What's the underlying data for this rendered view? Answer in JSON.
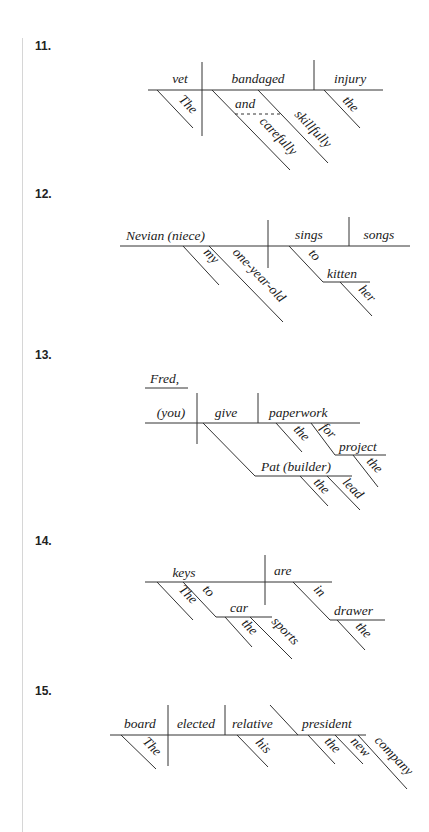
{
  "diagrams": [
    {
      "number": "11.",
      "baseline": {
        "subject": "vet",
        "verb": "bandaged",
        "object": "injury"
      },
      "modifiers": {
        "subject": [
          "The"
        ],
        "verb_conjunction": "and",
        "verb": [
          "carefully",
          "skillfully"
        ],
        "object": [
          "the"
        ]
      }
    },
    {
      "number": "12.",
      "baseline": {
        "subject": "Nevian (niece)",
        "verb": "sings",
        "object": "songs"
      },
      "modifiers": {
        "subject": [
          "my",
          "one-year-old"
        ],
        "verb_prep": "to",
        "prep_object": "kitten",
        "prep_object_mods": [
          "her"
        ]
      }
    },
    {
      "number": "13.",
      "address": "Fred,",
      "baseline": {
        "subject": "(you)",
        "verb": "give",
        "object": "paperwork"
      },
      "indirect_object": "Pat (builder)",
      "modifiers": {
        "object": [
          "the"
        ],
        "object_prep": "for",
        "prep_object": "project",
        "prep_object_mods": [
          "the"
        ],
        "indirect_mods": [
          "the",
          "lead"
        ]
      }
    },
    {
      "number": "14.",
      "baseline": {
        "subject": "keys",
        "verb": "are"
      },
      "modifiers": {
        "subject": [
          "The"
        ],
        "subject_prep": "to",
        "subject_prep_object": "car",
        "subject_prep_object_mods": [
          "the",
          "sports"
        ],
        "verb_prep": "in",
        "verb_prep_object": "drawer",
        "verb_prep_object_mods": [
          "the"
        ]
      }
    },
    {
      "number": "15.",
      "baseline": {
        "subject": "board",
        "verb": "elected",
        "object": "relative",
        "complement": "president"
      },
      "modifiers": {
        "subject": [
          "The"
        ],
        "object": [
          "his"
        ],
        "complement": [
          "the",
          "new",
          "company"
        ]
      }
    }
  ]
}
